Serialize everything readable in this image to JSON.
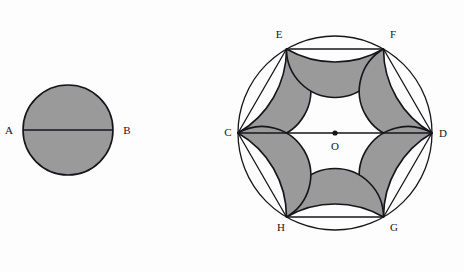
{
  "figure": {
    "background_color": "#fdfdfd",
    "shade_color": "#9a9a9a",
    "stroke_color": "#16151a",
    "stroke_width": 1.6,
    "thin_stroke_width": 1.3
  },
  "left_figure": {
    "name": "shaded-circle-with-diameter",
    "circle": {
      "center": {
        "x": 68,
        "y": 130
      },
      "radius": 45,
      "filled": true
    },
    "diameter": {
      "from": {
        "x": 23,
        "y": 130
      },
      "to": {
        "x": 113,
        "y": 130
      }
    },
    "labels": [
      {
        "text": "A",
        "x": 9,
        "y": 134,
        "anchor": "middle"
      },
      {
        "text": "B",
        "x": 127,
        "y": 134,
        "anchor": "middle"
      }
    ]
  },
  "right_figure": {
    "name": "hexagon-with-lunes",
    "circumcircle": {
      "center": {
        "x": 335,
        "y": 133
      },
      "radius": 97,
      "center_dot_radius": 2.6
    },
    "hexagon": {
      "vertex_order": [
        "C",
        "E",
        "F",
        "D",
        "G",
        "H"
      ],
      "vertices": [
        {
          "label": "C",
          "x": 238,
          "y": 133,
          "angle_deg": 180
        },
        {
          "label": "E",
          "x": 286.5,
          "y": 49,
          "angle_deg": 240
        },
        {
          "label": "F",
          "x": 383.5,
          "y": 49,
          "angle_deg": 300
        },
        {
          "label": "D",
          "x": 432,
          "y": 133,
          "angle_deg": 0
        },
        {
          "label": "G",
          "x": 383.5,
          "y": 217,
          "angle_deg": 60
        },
        {
          "label": "H",
          "x": 286.5,
          "y": 217,
          "angle_deg": 120
        }
      ],
      "side_length": 97
    },
    "lunes": {
      "count": 6,
      "description": "semicircle erected outward on each hexagon side, minus the circumcircle arc",
      "semicircle_radius": 48.5,
      "filled": true
    },
    "diagonal": {
      "name": "CD",
      "from": {
        "x": 238,
        "y": 133
      },
      "to": {
        "x": 432,
        "y": 133
      }
    },
    "labels": [
      {
        "text": "C",
        "x": 228,
        "y": 136,
        "anchor": "middle"
      },
      {
        "text": "E",
        "x": 279,
        "y": 38,
        "anchor": "middle"
      },
      {
        "text": "F",
        "x": 393,
        "y": 38,
        "anchor": "middle"
      },
      {
        "text": "D",
        "x": 443,
        "y": 137,
        "anchor": "middle"
      },
      {
        "text": "O",
        "x": 335,
        "y": 150,
        "anchor": "middle"
      },
      {
        "text": "G",
        "x": 394,
        "y": 231,
        "anchor": "middle"
      },
      {
        "text": "H",
        "x": 281,
        "y": 231,
        "anchor": "middle"
      }
    ]
  }
}
